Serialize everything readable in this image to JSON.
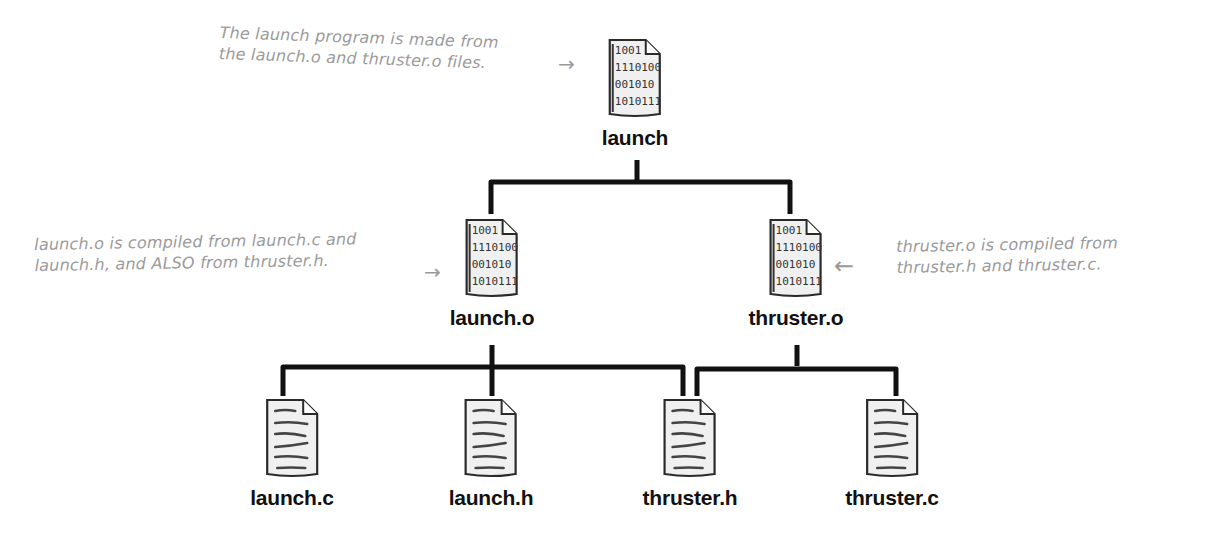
{
  "diagram": {
    "type": "dependency-tree",
    "colors": {
      "ink": "#111111",
      "annotation": "#9a9a9a",
      "file_fill": "#f0f0f0",
      "background": "#ffffff"
    },
    "nodes": [
      {
        "id": "launch",
        "label": "launch",
        "kind": "binary",
        "binary_lines": [
          "1001",
          "1110100",
          "001010",
          "1010111"
        ]
      },
      {
        "id": "launch_o",
        "label": "launch.o",
        "kind": "binary",
        "binary_lines": [
          "1001",
          "1110100",
          "001010",
          "1010111"
        ]
      },
      {
        "id": "thruster_o",
        "label": "thruster.o",
        "kind": "binary",
        "binary_lines": [
          "1001",
          "1110100",
          "001010",
          "1010111"
        ]
      },
      {
        "id": "launch_c",
        "label": "launch.c",
        "kind": "source"
      },
      {
        "id": "launch_h",
        "label": "launch.h",
        "kind": "source"
      },
      {
        "id": "thruster_h",
        "label": "thruster.h",
        "kind": "source"
      },
      {
        "id": "thruster_c",
        "label": "thruster.c",
        "kind": "source"
      }
    ],
    "edges": [
      {
        "from": "launch",
        "to": "launch_o"
      },
      {
        "from": "launch",
        "to": "thruster_o"
      },
      {
        "from": "launch_o",
        "to": "launch_c"
      },
      {
        "from": "launch_o",
        "to": "launch_h"
      },
      {
        "from": "launch_o",
        "to": "thruster_h"
      },
      {
        "from": "thruster_o",
        "to": "thruster_h"
      },
      {
        "from": "thruster_o",
        "to": "thruster_c"
      }
    ],
    "annotations": [
      {
        "id": "launch-note",
        "target": "launch",
        "lines": [
          "The launch program is made from",
          "the launch.o and thruster.o files."
        ],
        "arrow": "→"
      },
      {
        "id": "launch-o-note",
        "target": "launch_o",
        "lines": [
          "launch.o is compiled from launch.c and",
          "launch.h, and ALSO from thruster.h."
        ],
        "arrow": "→"
      },
      {
        "id": "thruster-o-note",
        "target": "thruster_o",
        "lines": [
          "thruster.o is compiled from",
          "thruster.h and thruster.c."
        ],
        "arrow": "←"
      }
    ]
  }
}
